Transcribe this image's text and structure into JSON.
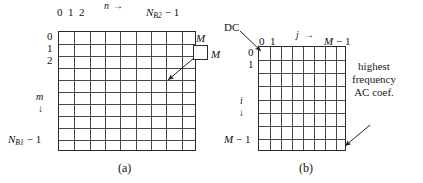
{
  "figure": {
    "background_color": "#ffffff",
    "ink_color": "#1a1a1a",
    "grid_line_color": "#4a4a4a",
    "panels": [
      {
        "id": "a",
        "caption": "(a)",
        "grid": {
          "columns": 9,
          "rows": 10
        },
        "axis_top": {
          "ticks": [
            "0",
            "1",
            "2"
          ],
          "variable": "n",
          "arrow": "→",
          "end_label_base": "N",
          "end_label_sub": "B2",
          "end_label_tail": "− 1"
        },
        "axis_left": {
          "ticks": [
            "0",
            "1",
            "2"
          ],
          "variable": "m",
          "arrow": "↓",
          "end_label_base": "N",
          "end_label_sub": "B1",
          "end_label_tail": "− 1"
        },
        "callout": {
          "box_label_top": "M",
          "box_label_right": "M"
        }
      },
      {
        "id": "b",
        "caption": "(b)",
        "grid": {
          "columns": 8,
          "rows": 8
        },
        "axis_top": {
          "ticks": [
            "0",
            "1"
          ],
          "variable": "j",
          "arrow": "→",
          "end_label": "M − 1"
        },
        "axis_left": {
          "ticks": [
            "0",
            "1"
          ],
          "variable": "i",
          "arrow": "↓",
          "end_label": "M − 1"
        },
        "callout_dc": {
          "label": "DC"
        },
        "callout_hf": {
          "line1": "highest",
          "line2": "frequency",
          "line3": "AC coef."
        }
      }
    ]
  }
}
